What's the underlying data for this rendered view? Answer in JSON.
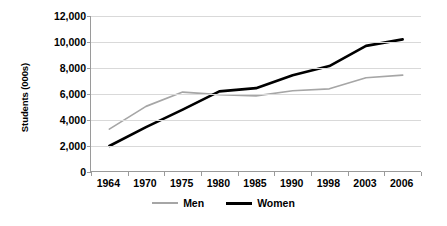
{
  "chart_data": {
    "type": "line",
    "title": "",
    "xlabel": "",
    "ylabel": "Students (000s)",
    "categories": [
      "1964",
      "1970",
      "1975",
      "1980",
      "1985",
      "1990",
      "1998",
      "2003",
      "2006"
    ],
    "ylim": [
      0,
      12000
    ],
    "ytick_labels": [
      "0",
      "2,000",
      "4,000",
      "6,000",
      "8,000",
      "10,000",
      "12,000"
    ],
    "ytick_values": [
      0,
      2000,
      4000,
      6000,
      8000,
      10000,
      12000
    ],
    "grid": true,
    "legend_position": "bottom",
    "series": [
      {
        "name": "Men",
        "color": "#a6a6a6",
        "values": [
          3300,
          5050,
          6150,
          5950,
          5850,
          6250,
          6400,
          7250,
          7450
        ]
      },
      {
        "name": "Women",
        "color": "#000000",
        "values": [
          2000,
          3450,
          4800,
          6200,
          6450,
          7450,
          8150,
          9700,
          10200
        ]
      }
    ]
  },
  "legend": {
    "items": [
      {
        "label": "Men",
        "color": "#a6a6a6"
      },
      {
        "label": "Women",
        "color": "#000000"
      }
    ]
  }
}
